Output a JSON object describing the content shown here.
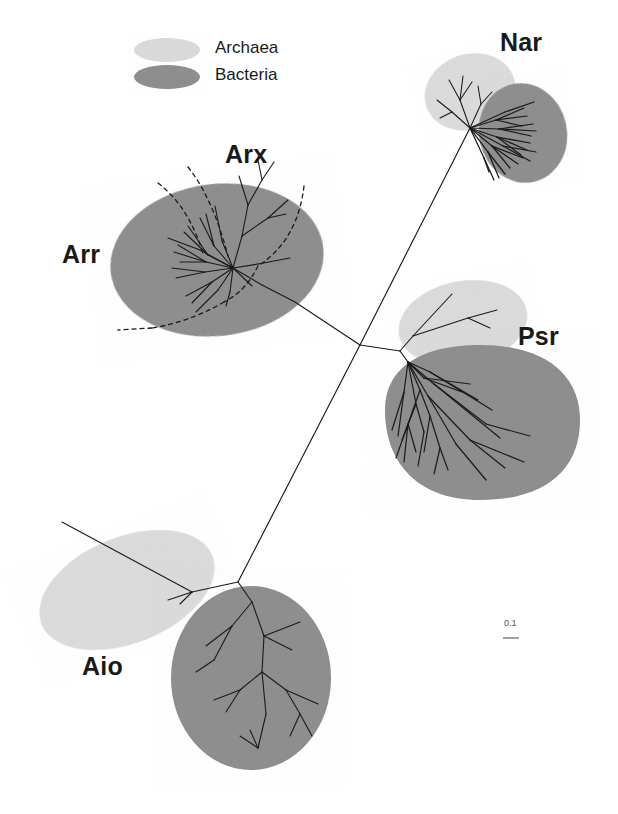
{
  "figure": {
    "type": "unrooted-phylogenetic-tree",
    "background_color": "#ffffff",
    "width": 618,
    "height": 814
  },
  "legend": {
    "items": [
      {
        "label": "Archaea",
        "color": "#d8d8d8",
        "swatch": "ellipse-light-gray"
      },
      {
        "label": "Bacteria",
        "color": "#8c8c8c",
        "swatch": "ellipse-dark-gray"
      }
    ]
  },
  "clades": [
    {
      "id": "arr",
      "label": "Arr",
      "domain": "Bacteria",
      "color": "#8c8c8c",
      "label_x": 150,
      "label_y": 243
    },
    {
      "id": "arx",
      "label": "Arx",
      "domain": "Bacteria",
      "color": "#8c8c8c",
      "label_x": 225,
      "label_y": 144,
      "subgroup_boundary": "dashed"
    },
    {
      "id": "nar",
      "label": "Nar",
      "domain": "Archaea+Bacteria",
      "color": "#8c8c8c",
      "label_x": 500,
      "label_y": 30
    },
    {
      "id": "psr",
      "label": "Psr",
      "domain": "Archaea+Bacteria",
      "color": "#8c8c8c",
      "label_x": 520,
      "label_y": 325
    },
    {
      "id": "aio",
      "label": "Aio",
      "domain": "Archaea+Bacteria",
      "color": "#8c8c8c",
      "label_x": 82,
      "label_y": 655
    }
  ],
  "scale_bar": {
    "label": "0.1",
    "x": 505,
    "y": 620,
    "bar_length_px": 14
  },
  "colors": {
    "archaea": "#d8d8d8",
    "bacteria": "#8c8c8c",
    "branch": "#1a1a1a",
    "dashed_boundary": "#1a1a1a",
    "text": "#1a1a1a"
  }
}
